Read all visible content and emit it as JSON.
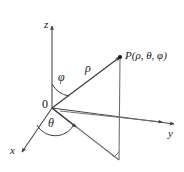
{
  "figure": {
    "kind": "spherical-coordinates-diagram",
    "title": "",
    "stroke_color": "#3a3a3a",
    "text_color": "#1a1a1a",
    "background_color": "#ffffff",
    "width": 184,
    "height": 172
  },
  "axes": [
    {
      "id": "z",
      "label": "z",
      "label_x": 44,
      "label_y": 19,
      "from": [
        52,
        108
      ],
      "to": [
        52,
        26
      ],
      "arrow": true
    },
    {
      "id": "y",
      "label": "y",
      "label_x": 168,
      "label_y": 128,
      "from": [
        52,
        108
      ],
      "to": [
        174,
        124
      ],
      "arrow": true
    },
    {
      "id": "x",
      "label": "x",
      "label_x": 10,
      "label_y": 145,
      "from": [
        52,
        108
      ],
      "to": [
        22,
        152
      ],
      "arrow": true
    }
  ],
  "origin": {
    "label": "0",
    "label_x": 42,
    "label_y": 98,
    "x": 52,
    "y": 108
  },
  "point": {
    "label": "P(ρ, θ, φ)",
    "label_x": 125,
    "label_y": 50,
    "x": 120,
    "y": 57,
    "dot_radius": 2.1
  },
  "segments": [
    {
      "id": "rho-ray",
      "from": [
        52,
        108
      ],
      "to": [
        120,
        57
      ],
      "arrow": true,
      "style": "solid"
    },
    {
      "id": "vertical-drop",
      "from": [
        120,
        57
      ],
      "to": [
        119,
        160
      ],
      "arrow": false,
      "style": "solid"
    },
    {
      "id": "origin-to-foot",
      "from": [
        52,
        108
      ],
      "to": [
        119,
        160
      ],
      "arrow": false,
      "style": "solid"
    },
    {
      "id": "projection-radial",
      "from": [
        52,
        108
      ],
      "to": [
        78,
        128
      ],
      "arrow": true,
      "style": "solid"
    },
    {
      "id": "horizontal-chord",
      "from": [
        60,
        111
      ],
      "to": [
        160,
        122
      ],
      "arrow": true,
      "style": "solid"
    }
  ],
  "angles": [
    {
      "id": "phi",
      "label": "φ",
      "label_x": 58,
      "label_y": 71,
      "arc_path": "M 52 83 A 25 25 0 0 0 70 95",
      "vertex": [
        52,
        108
      ],
      "description": "angle from positive z-axis to rho ray"
    },
    {
      "id": "theta",
      "label": "θ",
      "label_x": 48,
      "label_y": 117,
      "arc_path": "M 36 126 A 22 22 0 0 0 74 127",
      "vertex": [
        52,
        108
      ],
      "description": "angle from x-axis to projection in xy-plane"
    }
  ],
  "rho": {
    "label": "ρ",
    "label_x": 85,
    "label_y": 62
  },
  "right_angle": {
    "id": "right-angle-marker",
    "path": "M 106 150 L 113 157 L 119 151",
    "description": "right angle marker at foot of vertical drop"
  }
}
